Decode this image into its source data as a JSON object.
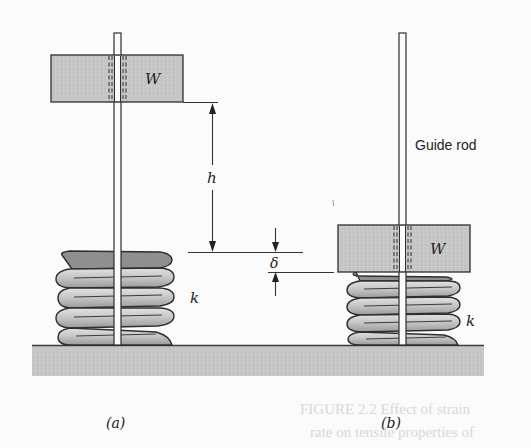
{
  "figure": {
    "panels": [
      {
        "id": "a",
        "caption": "(a)",
        "weight_label": "W",
        "spring_label": "k",
        "dimension_label": "h"
      },
      {
        "id": "b",
        "caption": "(b)",
        "weight_label": "W",
        "spring_label": "k",
        "rod_label": "Guide rod"
      }
    ],
    "deflection_label": "δ",
    "bleed_through_text": [
      "FIGURE 2.2 Effect of strain",
      "rate on tensile properties of"
    ]
  },
  "colors": {
    "background": "#fbfbfb",
    "ground_fill": "#c4c4c4",
    "weight_fill": "#c9c9c9",
    "spring_light": "#cfcfcf",
    "spring_dark": "#8a8a8a",
    "line": "#3a3a3a"
  }
}
